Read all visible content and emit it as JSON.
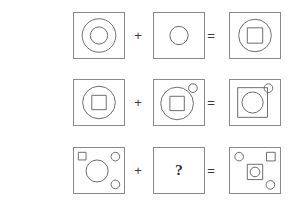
{
  "puzzle": {
    "title": "Visual analogy matrix puzzle",
    "description": "Three rows of shape-composition equations; the third row's second operand is unknown.",
    "operators": {
      "plus": "+",
      "equals": "="
    },
    "unknown_symbol": "?",
    "colors": {
      "stroke": "#6e6e6e",
      "panel_border": "#8a8a8a",
      "background": "#ffffff",
      "text": "#2b2b2b"
    },
    "layout": {
      "rows": 3,
      "columns": 3,
      "panel_width": 52,
      "panel_height": 47
    },
    "rows": [
      {
        "index": 1,
        "operand_a": {
          "name": "large-circle-with-inner-circle",
          "shapes": [
            "large outline circle centered",
            "small circle centered inside"
          ]
        },
        "operand_b": {
          "name": "single-small-circle",
          "shapes": [
            "small circle centered"
          ]
        },
        "result": {
          "name": "large-circle-with-inner-square",
          "shapes": [
            "large outline circle centered",
            "small square centered inside"
          ]
        }
      },
      {
        "index": 2,
        "operand_a": {
          "name": "circle-with-inner-square",
          "shapes": [
            "large outline circle centered",
            "square centered inside"
          ]
        },
        "operand_b": {
          "name": "circle-with-inner-square-and-corner-circle",
          "shapes": [
            "large outline circle centered",
            "square centered inside",
            "small circle at top-right corner"
          ]
        },
        "result": {
          "name": "square-with-inner-circle-and-corner-circle",
          "shapes": [
            "large square centered",
            "circle centered inside square",
            "small circle at top-right corner"
          ]
        }
      },
      {
        "index": 3,
        "operand_a": {
          "name": "circle-with-three-corner-marks",
          "shapes": [
            "small square at top-left",
            "small circle at top-right",
            "small circle at bottom-right",
            "large circle centered"
          ]
        },
        "operand_b": {
          "name": "unknown-panel",
          "shapes": [
            "question mark"
          ]
        },
        "result": {
          "name": "square-with-inner-circle-and-three-corner-marks",
          "shapes": [
            "small circle at top-left",
            "small square at top-right",
            "small circle at bottom-right",
            "square centered with small circle inside"
          ]
        }
      }
    ]
  }
}
